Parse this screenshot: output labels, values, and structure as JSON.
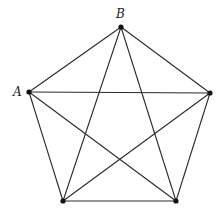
{
  "diagram": {
    "type": "graph",
    "vertices": [
      {
        "id": "B",
        "label": "B",
        "x": 121,
        "y": 27,
        "label_x": 116,
        "label_y": 18
      },
      {
        "id": "R",
        "label": "",
        "x": 210,
        "y": 93,
        "label_x": 0,
        "label_y": 0
      },
      {
        "id": "BR",
        "label": "",
        "x": 176,
        "y": 201,
        "label_x": 0,
        "label_y": 0
      },
      {
        "id": "BL",
        "label": "",
        "x": 63,
        "y": 201,
        "label_x": 0,
        "label_y": 0
      },
      {
        "id": "A",
        "label": "A",
        "x": 29,
        "y": 92,
        "label_x": 13,
        "label_y": 96
      }
    ],
    "edges": [
      [
        "B",
        "R"
      ],
      [
        "B",
        "BR"
      ],
      [
        "B",
        "BL"
      ],
      [
        "B",
        "A"
      ],
      [
        "R",
        "BR"
      ],
      [
        "R",
        "BL"
      ],
      [
        "R",
        "A"
      ],
      [
        "BR",
        "BL"
      ],
      [
        "BR",
        "A"
      ],
      [
        "BL",
        "A"
      ]
    ],
    "colors": {
      "edge": "#2a2a2a",
      "vertex": "#111111",
      "background": "#ffffff"
    }
  }
}
